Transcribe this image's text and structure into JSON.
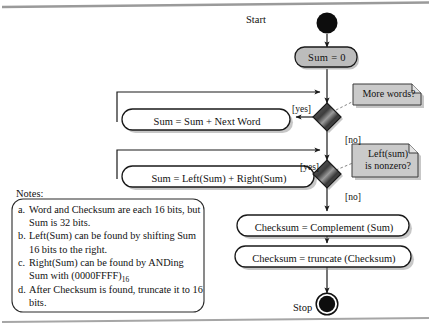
{
  "diagram": {
    "start_label": "Start",
    "stop_label": "Stop",
    "nodes": {
      "init": "Sum =  0",
      "add_word": "Sum = Sum + Next Word",
      "fold": "Sum = Left(Sum) + Right(Sum)",
      "complement": "Checksum = Complement (Sum)",
      "truncate": "Checksum = truncate (Checksum)"
    },
    "decisions": {
      "more_words": "More words?",
      "left_nonzero_line1": "Left(sum)",
      "left_nonzero_line2": "is nonzero?"
    },
    "edge_labels": {
      "yes1": "[yes]",
      "no1": "[no]",
      "yes2": "[yes]",
      "no2": "[no]"
    },
    "colors": {
      "fill_gray": "#b9b9b9",
      "note_gray": "#c9c9c9",
      "diamond_dark": "#4a4a4a",
      "stroke": "#1a1a1a",
      "page_rule": "#8a8a8a"
    }
  },
  "notes": {
    "label": "Notes:",
    "items": [
      {
        "letter": "a.",
        "line1": "Word and Checksum are each",
        "line2": "16 bits, but Sum is 32 bits."
      },
      {
        "letter": "b.",
        "line1": "Left(Sum) can be found by shifting",
        "line2": "Sum 16 bits to the right."
      },
      {
        "letter": "c.",
        "line1": "Right(Sum) can be found by",
        "line2_pre": "ANDing Sum with (0000FFFF)",
        "line2_sub": "16"
      },
      {
        "letter": "d.",
        "line1": "After Checksum is found, truncate",
        "line2": "it to 16 bits."
      }
    ]
  }
}
